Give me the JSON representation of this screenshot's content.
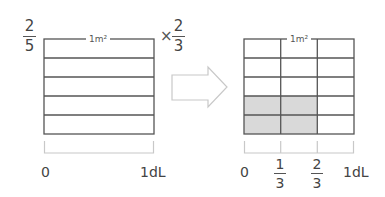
{
  "diagram": {
    "left_panel": {
      "fraction_left": {
        "numerator": "2",
        "denominator": "5"
      },
      "multiplier_symbol": "×",
      "fraction_right": {
        "numerator": "2",
        "denominator": "3"
      },
      "unit_label": "1m²",
      "rows": 5,
      "columns": 1,
      "shaded_cells": [],
      "axis_start": "0",
      "axis_end": "1dL"
    },
    "arrow": {
      "direction": "right"
    },
    "right_panel": {
      "unit_label": "1m²",
      "rows": 5,
      "columns": 3,
      "shaded_cells": [
        [
          3,
          0
        ],
        [
          3,
          1
        ],
        [
          4,
          0
        ],
        [
          4,
          1
        ]
      ],
      "axis_start": "0",
      "axis_ticks": [
        {
          "numerator": "1",
          "denominator": "3"
        },
        {
          "numerator": "2",
          "denominator": "3"
        }
      ],
      "axis_end": "1dL"
    },
    "colors": {
      "grid_line": "#555555",
      "shade": "#d9d9d9",
      "bracket": "#c8c8c8",
      "arrow_outline": "#c8c8c8"
    }
  }
}
